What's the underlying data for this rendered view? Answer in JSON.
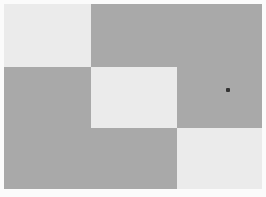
{
  "colors": {
    "background": "#fbfbfb",
    "dark": "#a9a9a9",
    "light": "#ebebeb",
    "cursor": "#333333"
  },
  "tiles": [
    {
      "name": "tile-top-left",
      "tone": "light",
      "x": 0,
      "y": 0,
      "w": 87,
      "h": 63
    },
    {
      "name": "tile-top-right",
      "tone": "dark",
      "x": 87,
      "y": 0,
      "w": 171,
      "h": 63
    },
    {
      "name": "tile-middle-left",
      "tone": "dark",
      "x": 0,
      "y": 63,
      "w": 87,
      "h": 61
    },
    {
      "name": "tile-center",
      "tone": "light",
      "x": 87,
      "y": 63,
      "w": 86,
      "h": 61
    },
    {
      "name": "tile-middle-right",
      "tone": "dark",
      "x": 173,
      "y": 63,
      "w": 85,
      "h": 61
    },
    {
      "name": "tile-bottom-left",
      "tone": "dark",
      "x": 0,
      "y": 124,
      "w": 173,
      "h": 61
    },
    {
      "name": "tile-bottom-right",
      "tone": "light",
      "x": 173,
      "y": 124,
      "w": 85,
      "h": 61
    }
  ],
  "cursor": {
    "x": 226,
    "y": 88
  }
}
